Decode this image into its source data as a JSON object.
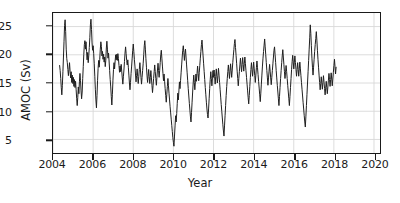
{
  "chart_data": {
    "type": "line",
    "title": "",
    "subtitle": "",
    "xlabel": "Year",
    "ylabel": "AMOC (Sv)",
    "xlim": [
      2004.0,
      2020.3
    ],
    "ylim": [
      2.6,
      27.4
    ],
    "xticks": [
      2004,
      2006,
      2008,
      2010,
      2012,
      2014,
      2016,
      2018,
      2020
    ],
    "xtick_labels": [
      "2004",
      "2006",
      "2008",
      "2010",
      "2012",
      "2014",
      "2016",
      "2018",
      "2020"
    ],
    "yticks": [
      5,
      10,
      15,
      20,
      25
    ],
    "ytick_labels": [
      "5",
      "10",
      "15",
      "20",
      "25"
    ],
    "grid": true,
    "grid_color": "#d8d8d8",
    "line_color": "#1f1f1f",
    "line_width": 1.0,
    "legend": null,
    "legend_position": "none",
    "series": [
      {
        "name": "AMOC transport",
        "units": "Sv",
        "x_start": 2004.33,
        "x_step": 0.0274,
        "values": [
          18.1,
          17.2,
          15.8,
          14.2,
          12.9,
          14.6,
          17.0,
          19.6,
          22.4,
          25.2,
          26.2,
          24.1,
          21.0,
          19.3,
          18.6,
          17.4,
          16.3,
          17.4,
          18.6,
          17.1,
          15.9,
          17.0,
          15.1,
          16.4,
          14.9,
          16.0,
          14.4,
          15.6,
          14.2,
          15.3,
          13.9,
          12.3,
          11.0,
          12.4,
          14.3,
          13.1,
          15.2,
          16.7,
          15.4,
          13.6,
          12.2,
          13.4,
          15.8,
          17.9,
          20.1,
          21.8,
          22.5,
          21.0,
          22.3,
          20.6,
          19.1,
          20.4,
          18.6,
          19.8,
          21.3,
          23.1,
          25.3,
          26.3,
          24.5,
          22.1,
          20.8,
          21.6,
          20.2,
          18.4,
          16.2,
          13.9,
          12.0,
          10.6,
          12.8,
          15.4,
          17.6,
          19.0,
          17.8,
          19.2,
          21.0,
          22.3,
          21.5,
          19.8,
          20.6,
          19.2,
          20.1,
          18.7,
          19.6,
          17.9,
          19.0,
          21.2,
          22.4,
          21.0,
          19.4,
          20.3,
          18.9,
          17.2,
          15.6,
          14.3,
          12.6,
          11.1,
          13.0,
          15.5,
          17.4,
          18.6,
          17.5,
          18.9,
          20.0,
          19.1,
          20.1,
          19.0,
          20.2,
          19.3,
          18.1,
          16.9,
          18.0,
          17.0,
          18.3,
          17.1,
          15.9,
          14.8,
          16.1,
          17.3,
          18.8,
          20.3,
          21.4,
          20.2,
          19.0,
          18.2,
          19.1,
          17.8,
          16.4,
          15.0,
          13.8,
          15.1,
          16.7,
          18.0,
          19.4,
          20.8,
          21.9,
          20.6,
          19.2,
          18.0,
          16.6,
          15.2,
          16.3,
          17.5,
          16.2,
          14.9,
          16.1,
          17.4,
          18.6,
          17.3,
          16.0,
          14.8,
          16.0,
          17.2,
          18.4,
          20.0,
          21.6,
          22.5,
          21.0,
          19.3,
          17.8,
          16.4,
          15.1,
          16.2,
          17.4,
          16.1,
          14.9,
          16.0,
          17.2,
          15.9,
          14.6,
          13.3,
          14.5,
          15.8,
          17.0,
          18.2,
          17.0,
          15.8,
          14.6,
          16.0,
          17.3,
          18.5,
          17.2,
          16.0,
          17.2,
          18.6,
          20.0,
          20.8,
          19.4,
          18.0,
          16.7,
          15.4,
          16.6,
          15.3,
          14.0,
          12.8,
          11.6,
          13.0,
          14.4,
          15.8,
          14.5,
          13.2,
          12.0,
          10.8,
          9.7,
          8.6,
          7.5,
          6.4,
          5.3,
          4.5,
          3.8,
          5.6,
          7.4,
          9.2,
          8.1,
          9.6,
          11.4,
          13.2,
          12.0,
          13.6,
          15.2,
          14.0,
          15.4,
          16.8,
          18.2,
          19.6,
          20.8,
          21.6,
          20.4,
          19.0,
          20.2,
          21.0,
          19.6,
          18.2,
          16.8,
          15.4,
          14.0,
          12.7,
          11.4,
          10.2,
          9.0,
          8.1,
          9.8,
          11.6,
          13.4,
          15.0,
          16.4,
          15.1,
          13.8,
          15.2,
          16.6,
          15.3,
          16.7,
          18.0,
          16.7,
          15.4,
          16.8,
          18.1,
          19.4,
          20.6,
          21.8,
          22.6,
          21.2,
          19.8,
          18.4,
          17.0,
          15.6,
          14.2,
          12.9,
          11.6,
          10.4,
          9.4,
          8.8,
          10.4,
          12.2,
          14.0,
          15.6,
          17.0,
          15.8,
          14.5,
          15.9,
          17.2,
          16.0,
          17.3,
          16.1,
          14.8,
          16.2,
          17.5,
          16.2,
          15.0,
          16.3,
          17.6,
          16.4,
          15.1,
          13.8,
          12.5,
          11.2,
          10.0,
          8.8,
          7.6,
          6.5,
          5.6,
          7.4,
          9.2,
          11.0,
          12.8,
          14.4,
          15.8,
          17.0,
          18.2,
          17.0,
          15.8,
          17.1,
          18.4,
          17.2,
          16.0,
          17.3,
          18.6,
          19.8,
          20.9,
          22.0,
          22.7,
          21.3,
          19.9,
          18.5,
          17.1,
          15.8,
          14.5,
          15.8,
          17.0,
          18.2,
          19.4,
          18.2,
          17.0,
          18.3,
          19.5,
          18.3,
          17.1,
          18.4,
          19.6,
          18.4,
          17.2,
          16.0,
          14.8,
          13.6,
          12.4,
          11.3,
          12.8,
          14.4,
          16.0,
          17.4,
          18.6,
          17.4,
          16.2,
          17.5,
          18.7,
          17.5,
          16.3,
          15.1,
          16.4,
          17.7,
          18.9,
          17.7,
          16.5,
          15.3,
          14.1,
          12.9,
          11.7,
          13.2,
          14.8,
          16.4,
          18.0,
          19.4,
          20.6,
          21.7,
          22.8,
          21.4,
          20.0,
          18.6,
          17.2,
          15.9,
          14.6,
          15.9,
          17.1,
          18.3,
          17.1,
          15.9,
          14.7,
          16.0,
          17.2,
          18.4,
          19.6,
          20.8,
          21.4,
          20.0,
          18.6,
          17.2,
          15.9,
          14.6,
          13.4,
          12.2,
          11.0,
          12.6,
          14.2,
          15.8,
          17.2,
          18.6,
          19.8,
          20.9,
          19.6,
          18.3,
          17.0,
          15.8,
          16.9,
          18.1,
          17.0,
          15.8,
          14.6,
          13.4,
          12.2,
          11.0,
          12.6,
          14.2,
          15.8,
          17.4,
          18.8,
          19.9,
          18.7,
          17.5,
          18.7,
          19.8,
          18.6,
          17.4,
          16.2,
          17.4,
          18.6,
          17.4,
          16.2,
          17.5,
          18.7,
          17.5,
          16.3,
          15.1,
          13.9,
          12.7,
          11.5,
          10.4,
          9.2,
          8.1,
          7.2,
          9.0,
          11.0,
          13.0,
          15.0,
          17.0,
          19.0,
          21.0,
          23.0,
          25.3,
          23.8,
          21.6,
          19.4,
          17.8,
          16.4,
          17.8,
          19.2,
          20.6,
          21.8,
          22.9,
          24.1,
          22.6,
          20.8,
          19.2,
          17.8,
          16.4,
          15.1,
          13.8,
          14.9,
          16.1,
          15.0,
          13.9,
          15.1,
          16.3,
          15.2,
          14.0,
          12.9,
          14.1,
          15.3,
          14.2,
          13.1,
          14.3,
          15.5,
          16.7,
          15.6,
          14.4,
          15.6,
          16.8,
          15.7,
          14.5,
          15.7,
          16.9,
          18.1,
          19.2,
          17.9,
          16.6,
          17.8
        ]
      }
    ],
    "annotations": [
      {
        "text": "minimum near early 2010",
        "x": 2010.1,
        "y": 3.8
      },
      {
        "text": "maximum near late 2005",
        "x": 2005.9,
        "y": 26.3
      }
    ]
  }
}
